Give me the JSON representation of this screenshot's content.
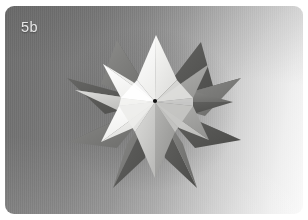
{
  "figure": {
    "caption_label": "5b",
    "caption_color": "#e8e8e8",
    "subject_description": "White folded-paper stellated polyhedron sculpture photographed against a graduated grey studio backdrop",
    "card": {
      "corner_radius_px": 9,
      "backdrop_dark_color": "#6e6e6e",
      "backdrop_mid_color": "#a4a4a4",
      "backdrop_light_color": "#fafafa",
      "gradient_direction": "diagonal-left-dark-to-right-light"
    },
    "model": {
      "center_x": 150,
      "center_y": 96,
      "spike_count": 12,
      "hub_dot_color": "#141414",
      "facet_colors": {
        "highlight": "#fdfdfd",
        "lit": "#f2f2f0",
        "mid": "#d4d4d2",
        "shade": "#a8a8a6",
        "dark": "#7e7e7c",
        "deep": "#5c5c5a",
        "deepest": "#464644"
      }
    }
  }
}
